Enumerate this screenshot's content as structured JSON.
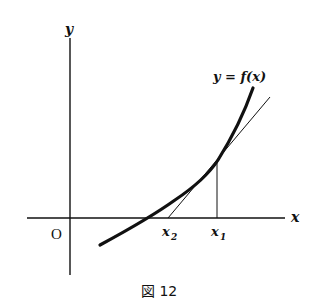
{
  "diagram": {
    "axis_labels": {
      "x": "x",
      "y": "y",
      "origin": "O"
    },
    "curve_label": "y = f(x)",
    "points": [
      {
        "label": "x",
        "sub": "2"
      },
      {
        "label": "x",
        "sub": "1"
      }
    ],
    "caption": "図 12",
    "colors": {
      "ink": "#111111",
      "background": "#ffffff"
    }
  }
}
